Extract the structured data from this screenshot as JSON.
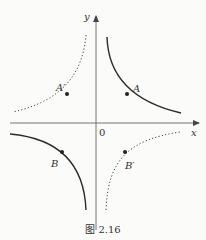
{
  "figure": {
    "caption": "图 2.16",
    "axes": {
      "x_label": "x",
      "y_label": "y",
      "origin_label": "0"
    },
    "points": {
      "A": "A",
      "A_prime": "A′",
      "B": "B",
      "B_prime": "B′"
    },
    "curves": [
      {
        "name": "branch-quadrant-1",
        "style": "solid",
        "point": "A"
      },
      {
        "name": "branch-quadrant-2",
        "style": "dotted",
        "point": "A′"
      },
      {
        "name": "branch-quadrant-3",
        "style": "solid",
        "point": "B"
      },
      {
        "name": "branch-quadrant-4",
        "style": "dotted",
        "point": "B′"
      }
    ],
    "colors": {
      "axis": "#555555",
      "curve": "#2a2a2a",
      "background": "#fbfbf9"
    }
  }
}
